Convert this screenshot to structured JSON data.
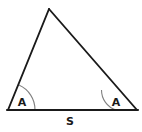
{
  "figure": {
    "type": "geometry-diagram",
    "shape": "triangle",
    "background_color": "#ffffff",
    "line_color": "#1a1a1a",
    "arc_color": "#808080",
    "label_color": "#1a1a1a",
    "vertices": {
      "apex": {
        "x": 49,
        "y": 9
      },
      "left": {
        "x": 8,
        "y": 110
      },
      "right": {
        "x": 137,
        "y": 110
      }
    },
    "edges": [
      {
        "name": "left-side",
        "from": "left",
        "to": "apex"
      },
      {
        "name": "right-side",
        "from": "apex",
        "to": "right"
      },
      {
        "name": "base",
        "from": "left",
        "to": "right"
      }
    ],
    "angle_marks": [
      {
        "name": "left-angle-arc",
        "vertex": "left",
        "radius": 27,
        "path": "M 35 110 A 27 27 0 0 0 18.9 85.0",
        "label": "A",
        "label_x": 22,
        "label_y": 103
      },
      {
        "name": "right-angle-arc",
        "vertex": "right",
        "radius": 21,
        "path": "M 116 110 A 21 21 0 0 1 101.5 89.9",
        "label": "A",
        "label_x": 116,
        "label_y": 103
      }
    ],
    "side_labels": [
      {
        "name": "base-side-label",
        "text": "S",
        "x": 70,
        "y": 122
      }
    ]
  }
}
